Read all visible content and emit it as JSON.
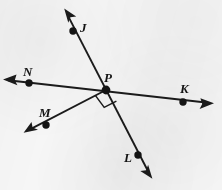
{
  "figure": {
    "kind": "geometry-diagram",
    "background_color": "#f6f6f6",
    "ink_color": "#1b1b1b",
    "width": 222,
    "height": 190,
    "labels": [
      {
        "id": "J",
        "text": "J",
        "x": 80,
        "y": 21
      },
      {
        "id": "N",
        "text": "N",
        "x": 23,
        "y": 65
      },
      {
        "id": "P",
        "text": "P",
        "x": 104,
        "y": 71
      },
      {
        "id": "K",
        "text": "K",
        "x": 180,
        "y": 82
      },
      {
        "id": "M",
        "text": "M",
        "x": 39,
        "y": 106
      },
      {
        "id": "L",
        "text": "L",
        "x": 124,
        "y": 151
      }
    ],
    "points": [
      {
        "id": "J",
        "x": 73,
        "y": 31,
        "r": 3.6
      },
      {
        "id": "N",
        "x": 29,
        "y": 83,
        "r": 3.6
      },
      {
        "id": "P",
        "x": 106,
        "y": 90,
        "r": 4.2
      },
      {
        "id": "K",
        "x": 183,
        "y": 102,
        "r": 3.6
      },
      {
        "id": "M",
        "x": 46,
        "y": 125,
        "r": 3.6
      },
      {
        "id": "L",
        "x": 138,
        "y": 155,
        "r": 3.6
      }
    ],
    "lines": [
      {
        "id": "line-NK",
        "name": "line-n-p-k",
        "x1": 6,
        "y1": 80,
        "x2": 211,
        "y2": 103,
        "arrows": "both"
      },
      {
        "id": "line-JL",
        "name": "line-j-p-l",
        "x1": 66,
        "y1": 12,
        "x2": 150,
        "y2": 175,
        "arrows": "both"
      },
      {
        "id": "ray-PM",
        "name": "ray-p-to-m",
        "x1": 106,
        "y1": 90,
        "x2": 27,
        "y2": 131,
        "arrows": "end"
      }
    ],
    "arrow_tips": [
      {
        "id": "arrow-NK-left",
        "x": 3,
        "y": 80
      },
      {
        "id": "arrow-NK-right",
        "x": 214,
        "y": 103
      },
      {
        "id": "arrow-J-up",
        "x": 64,
        "y": 9
      },
      {
        "id": "arrow-L-down",
        "x": 152,
        "y": 178
      },
      {
        "id": "arrow-M-down",
        "x": 24,
        "y": 133
      }
    ],
    "right_angle": {
      "id": "right-angle-at-P",
      "vertex_x": 106,
      "vertex_y": 90,
      "ray_a": "PM",
      "ray_b": "PL",
      "size": 13
    }
  }
}
